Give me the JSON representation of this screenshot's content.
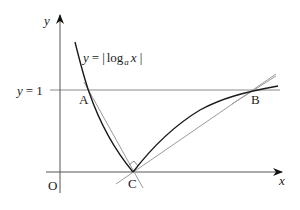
{
  "figure": {
    "type": "function-graph",
    "curve_label": "y = |log_a x|",
    "curve_label_parts": {
      "y": "y",
      "eq": "=",
      "bar_left": "|",
      "log": "log",
      "base": "a",
      "arg": "x",
      "bar_right": "|"
    },
    "axes": {
      "x_label": "x",
      "y_label": "y",
      "origin_label": "O"
    },
    "horizontal_line_label": "y = 1",
    "horizontal_line_label_parts": {
      "y": "y",
      "rest": "= 1"
    },
    "points": [
      {
        "name": "A",
        "description": "intersection of curve with y = 1 (left)"
      },
      {
        "name": "B",
        "description": "intersection of curve with y = 1 (right)"
      },
      {
        "name": "C",
        "description": "curve meets x-axis at x = 1"
      }
    ],
    "annotations": [
      "tangent lines at C and B",
      "right-angle mark at C",
      "line A-C"
    ],
    "colors": {
      "curve": "#1a1a1a",
      "axes": "#555555",
      "aux_lines": "#9a9a9a"
    }
  }
}
